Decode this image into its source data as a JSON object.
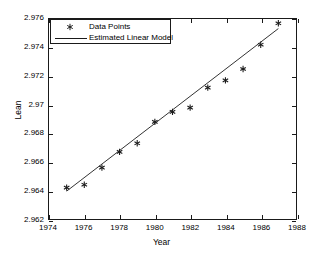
{
  "chart_data": {
    "type": "scatter",
    "title": "",
    "xlabel": "Year",
    "ylabel": "Lean",
    "xlim": [
      1974,
      1988
    ],
    "ylim": [
      2.962,
      2.976
    ],
    "xticks": [
      1974,
      1976,
      1978,
      1980,
      1982,
      1984,
      1986,
      1988
    ],
    "xticklabels": [
      "1974",
      "1976",
      "1978",
      "1980",
      "1982",
      "1984",
      "1986",
      "1988"
    ],
    "yticks": [
      2.962,
      2.964,
      2.966,
      2.968,
      2.97,
      2.972,
      2.974,
      2.976
    ],
    "yticklabels": [
      "2.962",
      "2.964",
      "2.966",
      "2.968",
      "2.97",
      "2.972",
      "2.974",
      "2.976"
    ],
    "grid": false,
    "legend_position": "upper left",
    "series": [
      {
        "name": "Data Points",
        "type": "scatter",
        "marker": "asterisk",
        "color": "#1a1a1a",
        "x": [
          1975,
          1976,
          1977,
          1978,
          1979,
          1980,
          1981,
          1982,
          1983,
          1984,
          1985,
          1986,
          1987
        ],
        "y": [
          2.9642,
          2.9644,
          2.9656,
          2.9667,
          2.9673,
          2.9688,
          2.9695,
          2.9698,
          2.9712,
          2.9717,
          2.9725,
          2.9742,
          2.9757
        ]
      },
      {
        "name": "Estimated Linear Model",
        "type": "line",
        "color": "#1a1a1a",
        "x": [
          1975,
          1987
        ],
        "y": [
          2.96395,
          2.97533
        ]
      }
    ]
  },
  "legend": {
    "entries": [
      {
        "label": "Data Points",
        "sample": "marker"
      },
      {
        "label": "Estimated Linear Model",
        "sample": "line"
      }
    ]
  },
  "axes": {
    "x_title": "Year",
    "y_title": "Lean"
  },
  "colors": {
    "axis": "#1a1a1a",
    "marker": "#1a1a1a",
    "line": "#1a1a1a",
    "background": "#ffffff"
  }
}
